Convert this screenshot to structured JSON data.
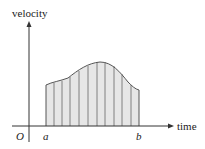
{
  "diagram": {
    "y_axis_label": "velocity",
    "x_axis_label": "time",
    "origin_label": "O",
    "left_bound_label": "a",
    "right_bound_label": "b",
    "strip_count": 11,
    "colors": {
      "fill": "#e6e6e6",
      "stroke": "#555555",
      "axis": "#333333"
    }
  }
}
